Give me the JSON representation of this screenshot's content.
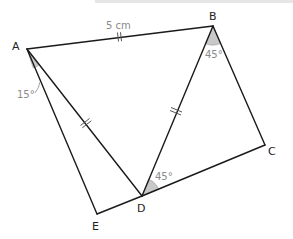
{
  "diagram": {
    "title_partial": "",
    "vertices": [
      {
        "id": "A",
        "label": "A",
        "x": 27,
        "y": 49
      },
      {
        "id": "B",
        "label": "B",
        "x": 213,
        "y": 26
      },
      {
        "id": "C",
        "label": "C",
        "x": 265,
        "y": 145
      },
      {
        "id": "D",
        "label": "D",
        "x": 142,
        "y": 196
      },
      {
        "id": "E",
        "label": "E",
        "x": 97,
        "y": 214
      }
    ],
    "edges": [
      {
        "from": "A",
        "to": "B",
        "ticks": 2
      },
      {
        "from": "A",
        "to": "D",
        "ticks": 2
      },
      {
        "from": "B",
        "to": "D",
        "ticks": 2
      },
      {
        "from": "B",
        "to": "C",
        "ticks": 0
      },
      {
        "from": "D",
        "to": "C",
        "ticks": 0
      },
      {
        "from": "A",
        "to": "E",
        "ticks": 0
      },
      {
        "from": "E",
        "to": "D",
        "ticks": 0
      }
    ],
    "length_labels": [
      {
        "edge": "AB",
        "text": "5 cm"
      }
    ],
    "angles": [
      {
        "vertex": "A",
        "between": [
          "E",
          "D"
        ],
        "text": "15°"
      },
      {
        "vertex": "B",
        "between": [
          "D",
          "C"
        ],
        "text": "45°"
      },
      {
        "vertex": "D",
        "between": [
          "C",
          "B"
        ],
        "text": "45°"
      }
    ],
    "labels": {
      "A": "A",
      "B": "B",
      "C": "C",
      "D": "D",
      "E": "E",
      "ab_length": "5 cm",
      "angle_a": "15°",
      "angle_b": "45°",
      "angle_d": "45°"
    },
    "colors": {
      "line": "#1a1a1a",
      "angle_fill": "#c8c8c8",
      "annotation_text": "#8a8a8a"
    }
  }
}
